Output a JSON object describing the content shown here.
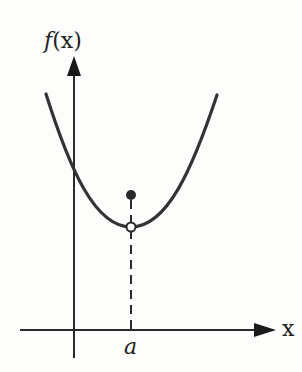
{
  "diagram": {
    "type": "function-graph-removable-discontinuity",
    "y_axis": {
      "label_fn": "f",
      "label_arg": "(x)"
    },
    "x_axis": {
      "label": "x"
    },
    "point_label": "a",
    "colors": {
      "stroke": "#333333",
      "background": "#fdfdfb",
      "text": "#222222"
    },
    "elements": [
      {
        "name": "parabola-curve",
        "description": "U-shaped curve with minimum at x=a"
      },
      {
        "name": "open-circle",
        "description": "hole in curve at (a, curve minimum)"
      },
      {
        "name": "filled-dot",
        "description": "actual value f(a), located above the curve minimum"
      },
      {
        "name": "dashed-line",
        "description": "vertical dashed line from f(a) down to x-axis at a"
      }
    ]
  }
}
